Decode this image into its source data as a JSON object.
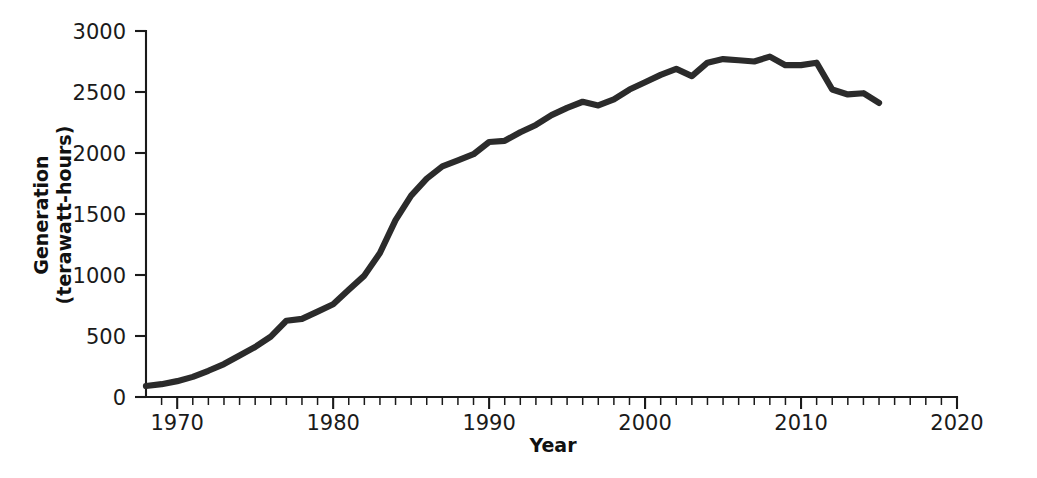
{
  "chart_data": {
    "type": "line",
    "title": "",
    "xlabel": "Year",
    "ylabel": "Generation (terawatt-hours)",
    "ylabel_line1": "Generation",
    "ylabel_line2": "(terawatt-hours)",
    "xlim": [
      1968,
      2020
    ],
    "ylim": [
      0,
      3000
    ],
    "x_ticks_major": [
      1970,
      1980,
      1990,
      2000,
      2010,
      2020
    ],
    "x_tick_labels": [
      "1970",
      "1980",
      "1990",
      "2000",
      "2010",
      "2020"
    ],
    "x_minor_tick_step": 1,
    "y_ticks": [
      0,
      500,
      1000,
      1500,
      2000,
      2500,
      3000
    ],
    "y_tick_labels": [
      "0",
      "500",
      "1000",
      "1500",
      "2000",
      "2500",
      "3000"
    ],
    "grid": false,
    "legend": null,
    "line_color": "#2b2b2b",
    "series": [
      {
        "name": "Nuclear electricity generation",
        "x": [
          1968,
          1969,
          1970,
          1971,
          1972,
          1973,
          1974,
          1975,
          1976,
          1977,
          1978,
          1979,
          1980,
          1981,
          1982,
          1983,
          1984,
          1985,
          1986,
          1987,
          1988,
          1989,
          1990,
          1991,
          1992,
          1993,
          1994,
          1995,
          1996,
          1997,
          1998,
          1999,
          2000,
          2001,
          2002,
          2003,
          2004,
          2005,
          2006,
          2007,
          2008,
          2009,
          2010,
          2011,
          2012,
          2013,
          2014,
          2015
        ],
        "values": [
          90,
          105,
          130,
          165,
          215,
          270,
          340,
          410,
          495,
          625,
          640,
          700,
          760,
          880,
          995,
          1180,
          1450,
          1650,
          1790,
          1890,
          1940,
          1990,
          2090,
          2100,
          2170,
          2230,
          2310,
          2370,
          2420,
          2390,
          2440,
          2520,
          2580,
          2640,
          2690,
          2630,
          2740,
          2770,
          2760,
          2750,
          2790,
          2720,
          2720,
          2740,
          2520,
          2480,
          2490,
          2410
        ]
      }
    ]
  },
  "figure": {
    "background_color": "#ffffff",
    "axis_color": "#1a1a1a"
  }
}
